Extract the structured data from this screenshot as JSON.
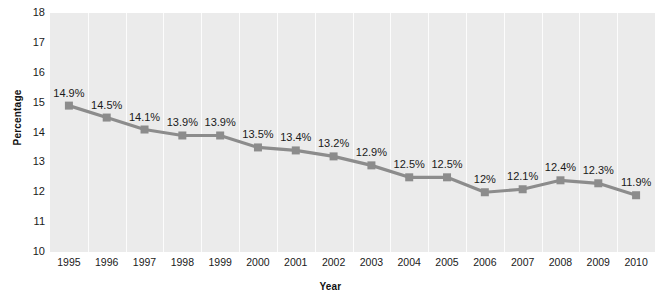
{
  "chart_data": {
    "type": "line",
    "title": "",
    "xlabel": "Year",
    "ylabel": "Percentage",
    "categories": [
      "1995",
      "1996",
      "1997",
      "1998",
      "1999",
      "2000",
      "2001",
      "2002",
      "2003",
      "2004",
      "2005",
      "2006",
      "2007",
      "2008",
      "2009",
      "2010"
    ],
    "values": [
      14.9,
      14.5,
      14.1,
      13.9,
      13.9,
      13.5,
      13.4,
      13.2,
      12.9,
      12.5,
      12.5,
      12.0,
      12.1,
      12.4,
      12.3,
      11.9
    ],
    "point_labels": [
      "14.9%",
      "14.5%",
      "14.1%",
      "13.9%",
      "13.9%",
      "13.5%",
      "13.4%",
      "13.2%",
      "12.9%",
      "12.5%",
      "12.5%",
      "12%",
      "12.1%",
      "12.4%",
      "12.3%",
      "11.9%"
    ],
    "ylim": [
      10,
      18
    ],
    "yticks": [
      "18",
      "17",
      "16",
      "15",
      "14",
      "13",
      "12",
      "11",
      "10"
    ],
    "grid": "vertical-only",
    "legend": "none",
    "series_color": "#8c8c8c",
    "marker": "square",
    "plot_background": "#ebebeb",
    "gridline_color": "#fcfcfc"
  },
  "ghost_text": [
    {
      "text": "the great the sample supplies",
      "x": 196,
      "y": 26,
      "size": 11,
      "serif": false
    },
    {
      "text": "supply the surface most on",
      "x": 418,
      "y": 26,
      "size": 11,
      "serif": false
    },
    {
      "text": "an dissipe i bepto",
      "x": 228,
      "y": 42,
      "size": 11,
      "serif": false
    },
    {
      "text": "expended on",
      "x": 434,
      "y": 42,
      "size": 11,
      "serif": false
    },
    {
      "text": "Obesity and Overweight",
      "x": 366,
      "y": 96,
      "size": 17,
      "serif": false
    },
    {
      "text": "and those Gooks the sector office to kids.",
      "x": 346,
      "y": 124,
      "size": 11,
      "serif": false
    },
    {
      "text": "The provide",
      "x": 236,
      "y": 124,
      "size": 11,
      "serif": false
    },
    {
      "text": "Gabrielle Bernice   Hunt Legal insurance",
      "x": 212,
      "y": 140,
      "size": 11,
      "serif": false
    },
    {
      "text": "best relate",
      "x": 70,
      "y": 186,
      "size": 11,
      "serif": false
    },
    {
      "text": "Our Chicago children",
      "x": 196,
      "y": 186,
      "size": 11,
      "serif": false
    },
    {
      "text": "provider countries",
      "x": 400,
      "y": 186,
      "size": 11,
      "serif": false
    },
    {
      "text": "the chiefing",
      "x": 92,
      "y": 210,
      "size": 11,
      "serif": false
    },
    {
      "text": "proportion a the",
      "x": 248,
      "y": 210,
      "size": 11,
      "serif": false
    },
    {
      "text": "presented on",
      "x": 432,
      "y": 210,
      "size": 11,
      "serif": false
    }
  ]
}
